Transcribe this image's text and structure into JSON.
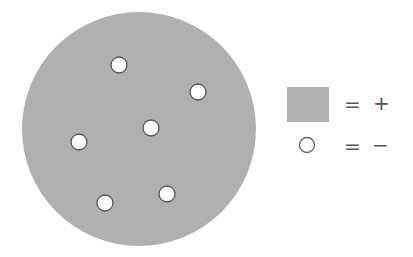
{
  "diagram": {
    "big_circle": {
      "cx": 139,
      "cy": 129,
      "r": 117,
      "fill": "#b0b0b0"
    },
    "small_circles": [
      {
        "cx": 119,
        "cy": 65,
        "r": 8
      },
      {
        "cx": 198,
        "cy": 92,
        "r": 8
      },
      {
        "cx": 151,
        "cy": 128,
        "r": 8
      },
      {
        "cx": 79,
        "cy": 142,
        "r": 8
      },
      {
        "cx": 105,
        "cy": 203,
        "r": 8
      },
      {
        "cx": 167,
        "cy": 194,
        "r": 8
      }
    ],
    "small_circle_fill": "#ffffff",
    "small_circle_stroke": "#555555"
  },
  "legend": {
    "items": [
      {
        "symbol": "gray-square",
        "equals": "=",
        "meaning": "+"
      },
      {
        "symbol": "white-circle",
        "equals": "=",
        "meaning": "−"
      }
    ]
  }
}
